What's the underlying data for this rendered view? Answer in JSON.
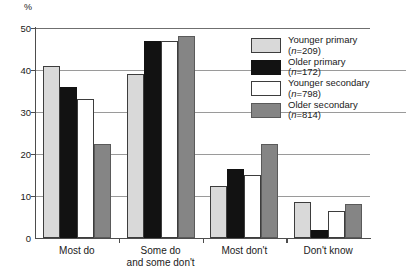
{
  "chart_data": {
    "type": "bar",
    "title": "",
    "subtitle": "",
    "xlabel": "",
    "ylabel": "%",
    "ylim": [
      0,
      50
    ],
    "yticks": [
      0,
      10,
      20,
      30,
      40,
      50
    ],
    "grid": true,
    "legend_position": "top-right-inside",
    "categories": [
      "Most do",
      "Some do and some don't",
      "Most don't",
      "Don't know"
    ],
    "category_lines": [
      [
        "Most do",
        ""
      ],
      [
        "Some do",
        "and some don't"
      ],
      [
        "Most don't",
        ""
      ],
      [
        "Don't know",
        ""
      ]
    ],
    "series": [
      {
        "name": "Younger primary",
        "n_label": "(n=209)",
        "n": 209,
        "color": "#d9d9d9",
        "values": [
          41,
          39,
          12.5,
          8.5
        ]
      },
      {
        "name": "Older primary",
        "n_label": "(n=172)",
        "n": 172,
        "color": "#121212",
        "values": [
          36,
          47,
          16.5,
          2
        ]
      },
      {
        "name": "Younger secondary",
        "n_label": "(n=798)",
        "n": 798,
        "color": "#ffffff",
        "values": [
          33,
          47,
          15,
          6.5
        ]
      },
      {
        "name": "Older secondary",
        "n_label": "(n=814)",
        "n": 814,
        "color": "#858585",
        "values": [
          22.5,
          48,
          22.5,
          8
        ]
      }
    ]
  },
  "axis": {
    "unit_label": "%",
    "tick_labels": [
      "0",
      "10",
      "20",
      "30",
      "40",
      "50"
    ]
  },
  "colors": {
    "axis": "#4d4d4d",
    "gridline": "#9a9a9a",
    "text": "#1a1a1a",
    "background": "#ffffff"
  }
}
